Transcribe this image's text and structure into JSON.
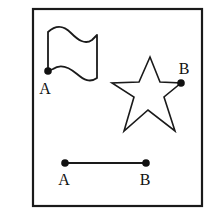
{
  "figure": {
    "background_color": "#ffffff",
    "ink_color": "#1a1a1a",
    "frame": {
      "name": "outer-border",
      "x": 33,
      "y": 9,
      "width": 169,
      "height": 197,
      "stroke_color": "#1a1a1a",
      "stroke_width": 2.2
    },
    "shapes": [
      {
        "id": "flag",
        "type": "wavy-flag",
        "label_point": "A",
        "outline_path": "M48,71 L48,32 C57,24 64,26 71,33 C78,40 85,45 92,40 L97,35 L97,78 C90,83 84,80 77,74 C70,68 61,63 53,69 Z"
      },
      {
        "id": "star",
        "type": "five-pointed-star",
        "label_point": "B",
        "outline_path": "M150,57 L160,82 L181,83 L164,97 L175,131 L148,110 L124,131 L134,97 L112,83 L139,82 Z"
      },
      {
        "id": "segment",
        "type": "line-segment",
        "label_points": [
          "A",
          "B"
        ],
        "x1": 65,
        "y1": 163,
        "x2": 146,
        "y2": 163
      }
    ],
    "points": [
      {
        "id": "flag-point-a",
        "label": "A",
        "cx": 48,
        "cy": 71,
        "r": 3.8,
        "label_x": 45,
        "label_y": 94
      },
      {
        "id": "star-point-b",
        "label": "B",
        "cx": 181,
        "cy": 83,
        "r": 3.8,
        "label_x": 178,
        "label_y": 74
      },
      {
        "id": "segment-point-a",
        "label": "A",
        "cx": 65,
        "cy": 163,
        "r": 3.8,
        "label_x": 60,
        "label_y": 185
      },
      {
        "id": "segment-point-b",
        "label": "B",
        "cx": 146,
        "cy": 163,
        "r": 3.8,
        "label_x": 141,
        "label_y": 185
      }
    ]
  }
}
